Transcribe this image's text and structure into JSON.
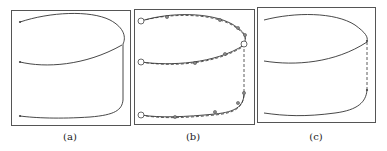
{
  "panels": [
    {
      "label": "(a)",
      "box": {
        "x": 11,
        "y": 10,
        "w": 119,
        "h": 115
      },
      "curves": [
        {
          "d": "M20,22 C50,12 90,10 110,20 C125,28 126,38 123,44",
          "style": "solid"
        },
        {
          "d": "M20,62 C45,68 85,66 122,45",
          "style": "solid"
        },
        {
          "d": "M123,44 L123,100",
          "style": "solid"
        },
        {
          "d": "M123,100 C122,110 115,115 90,117 C60,119 35,118 20,116",
          "style": "solid"
        }
      ],
      "points": [
        [
          20,
          22
        ],
        [
          20,
          62
        ],
        [
          20,
          116
        ]
      ],
      "point_style": "dot"
    },
    {
      "label": "(b)",
      "box": {
        "x": 134,
        "y": 9,
        "w": 120,
        "h": 115
      },
      "curves": [
        {
          "d": "M141,21 C170,12 210,12 232,24 C245,32 246,36 245,41",
          "style": "solid"
        },
        {
          "d": "M141,62 C170,66 215,64 244,45",
          "style": "solid"
        },
        {
          "d": "M244,44 L244,95",
          "style": "dashed"
        },
        {
          "d": "M244,95 C243,106 236,112 215,114 C185,117 160,118 141,115",
          "style": "solid"
        },
        {
          "d": "M141,21 C170,13 210,13 232,25 C245,33 246,37 245,42",
          "style": "dashed"
        },
        {
          "d": "M141,62 C170,67 215,65 244,46",
          "style": "dashed"
        },
        {
          "d": "M244,95 C243,107 236,113 215,115 C185,118 160,119 141,115",
          "style": "dashed"
        }
      ],
      "points": [
        [
          167,
          17
        ],
        [
          220,
          20
        ],
        [
          238,
          28
        ],
        [
          245,
          35
        ],
        [
          243,
          43
        ],
        [
          225,
          54
        ],
        [
          195,
          63
        ],
        [
          244,
          93
        ],
        [
          238,
          103
        ],
        [
          215,
          112
        ],
        [
          175,
          117
        ]
      ],
      "open_points": [
        [
          141,
          21
        ],
        [
          141,
          62
        ],
        [
          141,
          115
        ],
        [
          244,
          44
        ]
      ],
      "point_style": "circle"
    },
    {
      "label": "(c)",
      "box": {
        "x": 257,
        "y": 7,
        "w": 118,
        "h": 115
      },
      "curves": [
        {
          "d": "M264,20 C295,12 335,12 355,25 C366,33 368,37 367,41",
          "style": "solid"
        },
        {
          "d": "M264,61 C295,66 335,63 367,42",
          "style": "solid"
        },
        {
          "d": "M367,42 L367,90",
          "style": "dashed"
        },
        {
          "d": "M367,90 C366,102 358,110 335,113 C305,117 285,116 264,113",
          "style": "solid"
        }
      ],
      "points": [
        [
          367,
          41
        ],
        [
          367,
          90
        ]
      ],
      "point_style": "dot"
    }
  ],
  "labels": [
    {
      "text": "(a)",
      "x": 70,
      "y": 131
    },
    {
      "text": "(b)",
      "x": 193,
      "y": 131
    },
    {
      "text": "(c)",
      "x": 316,
      "y": 131
    }
  ],
  "colors": {
    "stroke": "#333333",
    "border": "#555555",
    "point": "#444444"
  }
}
